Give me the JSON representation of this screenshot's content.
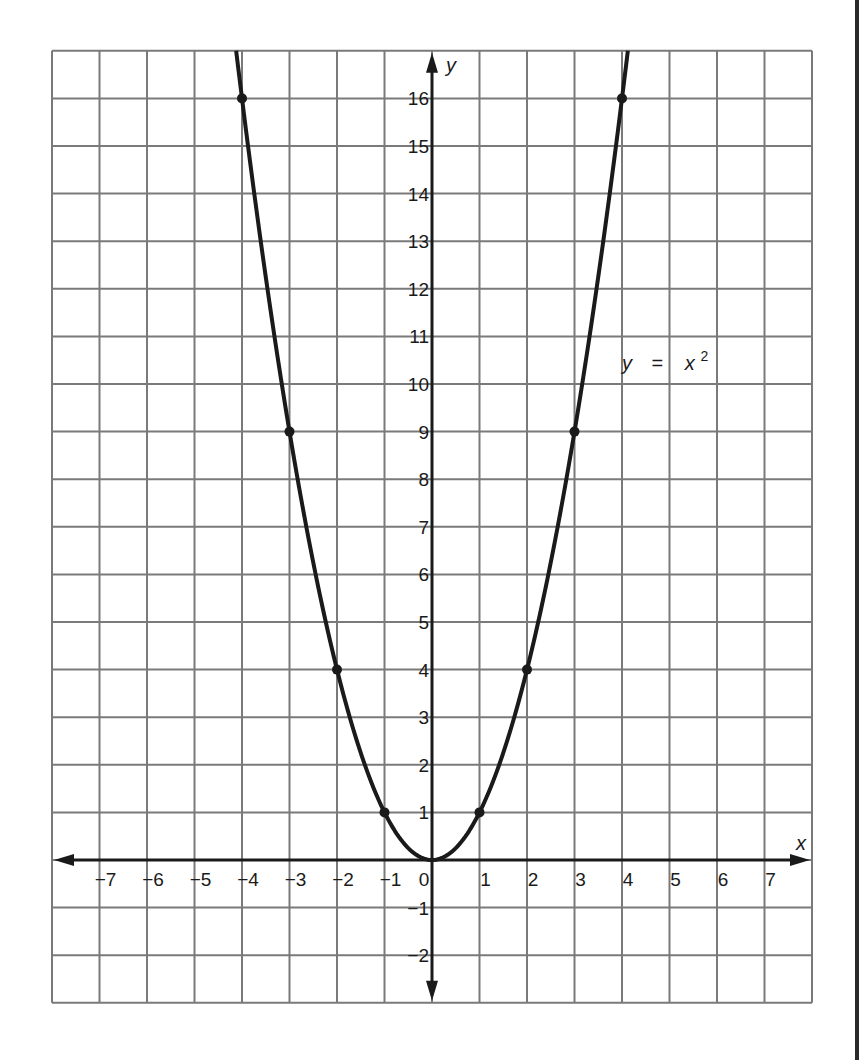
{
  "chart_data": {
    "type": "line",
    "title": "",
    "xlabel": "x",
    "ylabel": "y",
    "xlim": [
      -8,
      8
    ],
    "ylim": [
      -3,
      17
    ],
    "grid": true,
    "x_ticks": [
      -7,
      -6,
      -5,
      -4,
      -3,
      -2,
      -1,
      0,
      1,
      2,
      3,
      4,
      5,
      6,
      7
    ],
    "x_tick_labels": [
      "−7",
      "−6",
      "−5",
      "−4",
      "−3",
      "−2",
      "−1",
      "0",
      "1",
      "2",
      "3",
      "4",
      "5",
      "6",
      "7"
    ],
    "y_ticks": [
      -2,
      -1,
      1,
      2,
      3,
      4,
      5,
      6,
      7,
      8,
      9,
      10,
      11,
      12,
      13,
      14,
      15,
      16
    ],
    "y_tick_labels": [
      "−2",
      "−1",
      "1",
      "2",
      "3",
      "4",
      "5",
      "6",
      "7",
      "8",
      "9",
      "10",
      "11",
      "12",
      "13",
      "14",
      "15",
      "16"
    ],
    "series": [
      {
        "name": "y = x²",
        "function": "x^2",
        "marked_points": [
          {
            "x": -4,
            "y": 16
          },
          {
            "x": -3,
            "y": 9
          },
          {
            "x": -2,
            "y": 4
          },
          {
            "x": -1,
            "y": 1
          },
          {
            "x": 0,
            "y": 0
          },
          {
            "x": 1,
            "y": 1
          },
          {
            "x": 2,
            "y": 4
          },
          {
            "x": 3,
            "y": 9
          },
          {
            "x": 4,
            "y": 16
          }
        ]
      }
    ],
    "annotations": [
      {
        "text_var": "y",
        "text_eq": "=",
        "text_base": "x",
        "text_exp": "2",
        "x": 4.5,
        "y": 10.4
      }
    ]
  },
  "colors": {
    "grid": "#7a7a7a",
    "axis": "#1a1a1a",
    "curve": "#1a1a1a",
    "background": "#ffffff"
  }
}
